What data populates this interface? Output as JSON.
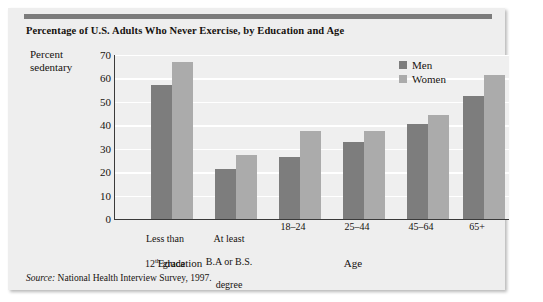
{
  "chart_data": {
    "type": "bar",
    "title": "Percentage of U.S. Adults Who Never Exercise, by Education and Age",
    "xlabel": "",
    "ylabel": "Percent sedentary",
    "ylim": [
      0,
      70
    ],
    "yticks": [
      0,
      10,
      20,
      30,
      40,
      50,
      60,
      70
    ],
    "grid": true,
    "legend_position": "top-right",
    "categories": [
      "Less than 12th grade",
      "At least B.A or B.S. degree",
      "18–24",
      "25–44",
      "45–64",
      "65+"
    ],
    "category_lines": [
      [
        "Less than",
        "12",
        "th",
        " grade"
      ],
      [
        "At least",
        "B.A or B.S.",
        "degree"
      ],
      [
        "18–24"
      ],
      [
        "25–44"
      ],
      [
        "45–64"
      ],
      [
        "65+"
      ]
    ],
    "series": [
      {
        "name": "Men",
        "color": "#7d7d7d",
        "values": [
          57,
          21.5,
          26.5,
          33,
          40.5,
          52.5
        ]
      },
      {
        "name": "Women",
        "color": "#ababab",
        "values": [
          67,
          27.5,
          37.5,
          37.5,
          44.5,
          61.5
        ]
      }
    ],
    "group_labels": [
      {
        "text": "Education",
        "spans": [
          0,
          1
        ]
      },
      {
        "text": "Age",
        "spans": [
          2,
          5
        ]
      }
    ],
    "source": {
      "label": "Source:",
      "text": "National Health Interview Survey, 1997."
    }
  },
  "axis": {
    "y_title_line1": "Percent",
    "y_title_line2": "sedentary"
  },
  "cats": {
    "c0_l1": "Less than",
    "c0_l2a": "12",
    "c0_sup": "th",
    "c0_l2b": " grade",
    "c1_l1": "At least",
    "c1_l2": "B.A or B.S.",
    "c1_l3": "degree",
    "c2": "18–24",
    "c3": "25–44",
    "c4": "45–64",
    "c5": "65+"
  },
  "ytick_labels": {
    "t0": "0",
    "t10": "10",
    "t20": "20",
    "t30": "30",
    "t40": "40",
    "t50": "50",
    "t60": "60",
    "t70": "70"
  },
  "legend": {
    "men": "Men",
    "women": "Women"
  },
  "groups": {
    "education": "Education",
    "age": "Age"
  },
  "source": {
    "label": "Source:",
    "text": " National Health Interview Survey, 1997."
  }
}
